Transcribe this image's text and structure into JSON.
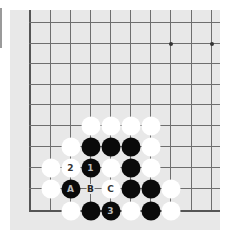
{
  "board": {
    "background": "#e8e8e8",
    "columns_x": [
      29,
      50,
      70,
      90,
      110,
      130,
      150,
      170,
      191,
      211
    ],
    "rows_y": [
      22,
      43,
      63,
      84,
      104,
      125,
      146,
      167,
      188,
      210
    ],
    "left_edge_col": 0,
    "bottom_edge_row": 9,
    "star_points": [
      [
        7,
        1
      ],
      [
        9,
        1
      ]
    ]
  },
  "stones": [
    {
      "color": "white",
      "col": 3,
      "row": 5,
      "label": ""
    },
    {
      "color": "white",
      "col": 4,
      "row": 5,
      "label": ""
    },
    {
      "color": "white",
      "col": 5,
      "row": 5,
      "label": ""
    },
    {
      "color": "white",
      "col": 6,
      "row": 5,
      "label": ""
    },
    {
      "color": "white",
      "col": 2,
      "row": 6,
      "label": ""
    },
    {
      "color": "black",
      "col": 3,
      "row": 6,
      "label": ""
    },
    {
      "color": "black",
      "col": 4,
      "row": 6,
      "label": ""
    },
    {
      "color": "black",
      "col": 5,
      "row": 6,
      "label": ""
    },
    {
      "color": "white",
      "col": 6,
      "row": 6,
      "label": ""
    },
    {
      "color": "white",
      "col": 1,
      "row": 7,
      "label": ""
    },
    {
      "color": "white",
      "col": 2,
      "row": 7,
      "label": "2"
    },
    {
      "color": "black",
      "col": 3,
      "row": 7,
      "label": "1"
    },
    {
      "color": "white",
      "col": 4,
      "row": 7,
      "label": ""
    },
    {
      "color": "black",
      "col": 5,
      "row": 7,
      "label": ""
    },
    {
      "color": "white",
      "col": 6,
      "row": 7,
      "label": ""
    },
    {
      "color": "white",
      "col": 1,
      "row": 8,
      "label": ""
    },
    {
      "color": "black",
      "col": 2,
      "row": 8,
      "label": "A"
    },
    {
      "color": "white",
      "col": 4,
      "row": 8,
      "label": "C"
    },
    {
      "color": "black",
      "col": 5,
      "row": 8,
      "label": ""
    },
    {
      "color": "black",
      "col": 6,
      "row": 8,
      "label": ""
    },
    {
      "color": "white",
      "col": 7,
      "row": 8,
      "label": ""
    },
    {
      "color": "white",
      "col": 2,
      "row": 9,
      "label": ""
    },
    {
      "color": "black",
      "col": 3,
      "row": 9,
      "label": ""
    },
    {
      "color": "black",
      "col": 4,
      "row": 9,
      "label": "3"
    },
    {
      "color": "white",
      "col": 5,
      "row": 9,
      "label": ""
    },
    {
      "color": "black",
      "col": 6,
      "row": 9,
      "label": ""
    },
    {
      "color": "white",
      "col": 7,
      "row": 9,
      "label": ""
    }
  ],
  "empty_labels": [
    {
      "col": 3,
      "row": 8,
      "label": "B"
    }
  ]
}
